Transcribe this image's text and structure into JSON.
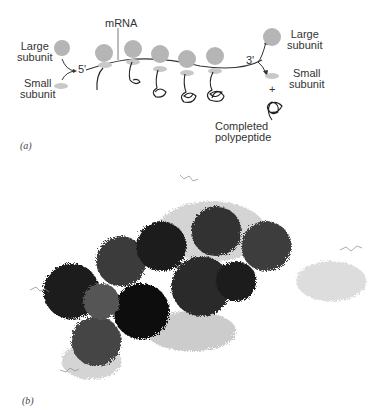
{
  "panel_a": {
    "label": "(a)",
    "mrna_label": "mRNA",
    "five_prime": "5'",
    "three_prime": "3'",
    "left_large": [
      "Large",
      "subunit"
    ],
    "left_small": [
      "Small",
      "subunit"
    ],
    "right_large": [
      "Large",
      "subunit"
    ],
    "right_small": [
      "Small",
      "subunit"
    ],
    "plus": "+",
    "completed": [
      "Completed",
      "polypeptide"
    ],
    "colors": {
      "subunit": "#b5b5b5",
      "small_subunit": "#c8c8c8",
      "line": "#333333"
    }
  },
  "panel_b": {
    "label": "(b)",
    "description": "molecular model of polysome"
  }
}
